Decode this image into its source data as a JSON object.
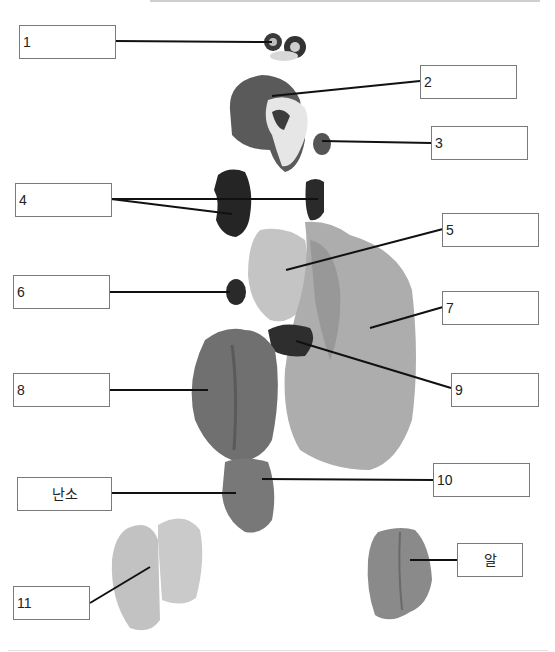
{
  "diagram": {
    "labels": [
      {
        "id": "1",
        "text": "1"
      },
      {
        "id": "2",
        "text": "2"
      },
      {
        "id": "3",
        "text": "3"
      },
      {
        "id": "4",
        "text": "4"
      },
      {
        "id": "5",
        "text": "5"
      },
      {
        "id": "6",
        "text": "6"
      },
      {
        "id": "7",
        "text": "7"
      },
      {
        "id": "8",
        "text": "8"
      },
      {
        "id": "9",
        "text": "9"
      },
      {
        "id": "10",
        "text": "10"
      },
      {
        "id": "ovary",
        "text": "난소"
      },
      {
        "id": "11",
        "text": "11"
      },
      {
        "id": "egg",
        "text": "알"
      }
    ],
    "colors": {
      "box_border": "#7a7a7a",
      "leader_line": "#111111",
      "dark_organ": "#2a2a2a",
      "mid_organ": "#6e6e6e",
      "light_organ": "#b8b8b8",
      "pale_organ": "#d6d6d6"
    }
  }
}
